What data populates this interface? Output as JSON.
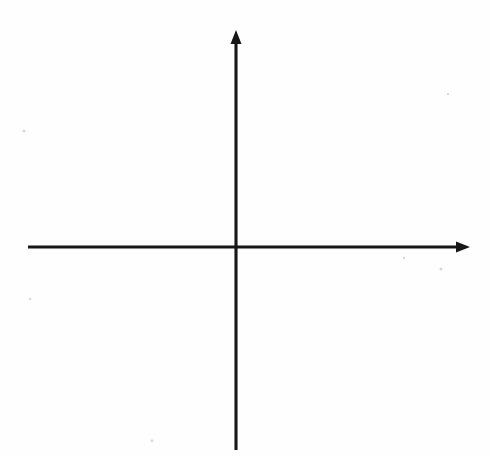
{
  "figure": {
    "kind": "cartesian-coordinate-grid",
    "background_color": "#fefefe",
    "ink_color": "#171717",
    "grid_color": "#b9b9b9"
  },
  "chart_data": {
    "type": "scatter",
    "title": "",
    "xlabel": "x",
    "ylabel": "y",
    "xlim": [
      -6.5,
      6.5
    ],
    "ylim": [
      -6.5,
      6.5
    ],
    "grid": true,
    "legend": null,
    "series": [],
    "x": [],
    "y": [],
    "x_tick_values": [
      -6,
      -5,
      -4,
      -3,
      -2,
      -1,
      0,
      1,
      2,
      3,
      4,
      5,
      6
    ],
    "y_tick_values": [
      -6,
      -5,
      -4,
      -3,
      -2,
      -1,
      0,
      1,
      2,
      3,
      4,
      5,
      6
    ],
    "x_labeled_ticks": [
      -6,
      -4,
      -2,
      2,
      4,
      6
    ],
    "y_labeled_ticks": [
      -6,
      -4,
      -2,
      2,
      4,
      6
    ],
    "grid_step": 1,
    "tick_step": 1,
    "label_step": 2
  },
  "axes": {
    "x_axis_label": "x",
    "y_axis_label": "y",
    "x_labels": [
      {
        "value": -6,
        "text": "–6"
      },
      {
        "value": -4,
        "text": "–4"
      },
      {
        "value": -2,
        "text": "–2"
      },
      {
        "value": 2,
        "text": "2"
      },
      {
        "value": 4,
        "text": "4"
      },
      {
        "value": 6,
        "text": "6"
      }
    ],
    "y_labels": [
      {
        "value": 6,
        "text": "6"
      },
      {
        "value": 4,
        "text": "4"
      },
      {
        "value": 2,
        "text": "2"
      },
      {
        "value": -2,
        "text": "–2"
      },
      {
        "value": -4,
        "text": "–4"
      },
      {
        "value": -6,
        "text": "–6"
      }
    ],
    "origin_label": ""
  },
  "geometry": {
    "origin_px": {
      "x": 236,
      "y": 247
    },
    "unit_px": 29.5,
    "grid_min_unit": -6.5,
    "grid_max_unit": 6.5
  }
}
